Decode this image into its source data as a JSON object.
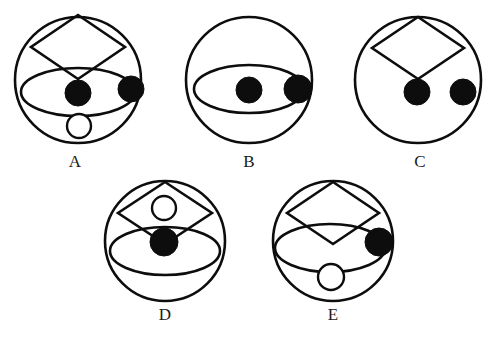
{
  "page": {
    "background_color": "#ffffff",
    "ink_color": "#0d0d0d",
    "width": 495,
    "height": 339
  },
  "figures": [
    {
      "id": "A",
      "label": "A",
      "label_x": 75,
      "label_y": 167,
      "circle": {
        "cx": 78,
        "cy": 80,
        "r": 63,
        "stroke_width": 2.6
      },
      "parts": [
        {
          "name": "diamond",
          "cx": 78,
          "cy": 47,
          "rx": 47,
          "ry": 32,
          "stroke_width": 2.6
        },
        {
          "name": "ellipse",
          "cx": 78,
          "cy": 92,
          "rx": 57,
          "ry": 24,
          "stroke_width": 2.6
        },
        {
          "name": "dot-center",
          "cx": 78,
          "cy": 93,
          "r": 13
        },
        {
          "name": "dot-right",
          "cx": 131,
          "cy": 89,
          "r": 13
        },
        {
          "name": "small-circle-below",
          "cx": 79,
          "cy": 126,
          "r": 12,
          "stroke_width": 2.4
        }
      ]
    },
    {
      "id": "B",
      "label": "B",
      "label_x": 249,
      "label_y": 167,
      "circle": {
        "cx": 249,
        "cy": 80,
        "r": 63,
        "stroke_width": 2.6
      },
      "parts": [
        {
          "name": "ellipse",
          "cx": 249,
          "cy": 89,
          "rx": 55,
          "ry": 24,
          "stroke_width": 2.6
        },
        {
          "name": "dot-center",
          "cx": 249,
          "cy": 90,
          "r": 13
        },
        {
          "name": "dot-right",
          "cx": 298,
          "cy": 89,
          "r": 14
        }
      ]
    },
    {
      "id": "C",
      "label": "C",
      "label_x": 420,
      "label_y": 167,
      "circle": {
        "cx": 418,
        "cy": 80,
        "r": 63,
        "stroke_width": 2.6
      },
      "parts": [
        {
          "name": "diamond",
          "cx": 418,
          "cy": 48,
          "rx": 46,
          "ry": 31,
          "stroke_width": 2.6
        },
        {
          "name": "dot-center",
          "cx": 417,
          "cy": 92,
          "r": 13
        },
        {
          "name": "dot-right",
          "cx": 463,
          "cy": 92,
          "r": 13
        }
      ]
    },
    {
      "id": "D",
      "label": "D",
      "label_x": 165,
      "label_y": 320,
      "circle": {
        "cx": 165,
        "cy": 241,
        "r": 60,
        "stroke_width": 2.6
      },
      "parts": [
        {
          "name": "diamond",
          "cx": 165,
          "cy": 213,
          "rx": 47,
          "ry": 31,
          "stroke_width": 2.6
        },
        {
          "name": "ellipse",
          "cx": 165,
          "cy": 251,
          "rx": 55,
          "ry": 24,
          "stroke_width": 2.6
        },
        {
          "name": "small-circle-in-diamond",
          "cx": 164,
          "cy": 208,
          "r": 12,
          "stroke_width": 2.4
        },
        {
          "name": "dot-center",
          "cx": 164,
          "cy": 242,
          "r": 14
        }
      ]
    },
    {
      "id": "E",
      "label": "E",
      "label_x": 333,
      "label_y": 320,
      "circle": {
        "cx": 333,
        "cy": 241,
        "r": 60,
        "stroke_width": 2.6
      },
      "parts": [
        {
          "name": "diamond",
          "cx": 333,
          "cy": 213,
          "rx": 46,
          "ry": 31,
          "stroke_width": 2.6
        },
        {
          "name": "ellipse",
          "cx": 330,
          "cy": 248,
          "rx": 55,
          "ry": 24,
          "stroke_width": 2.6
        },
        {
          "name": "dot-right",
          "cx": 379,
          "cy": 242,
          "r": 14
        },
        {
          "name": "small-circle-below",
          "cx": 331,
          "cy": 277,
          "r": 13,
          "stroke_width": 2.4
        }
      ]
    }
  ]
}
